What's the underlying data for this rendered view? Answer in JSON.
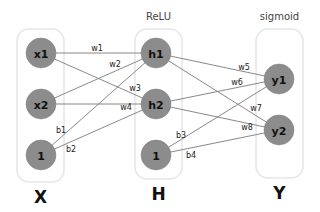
{
  "layers": [
    {
      "id": "X",
      "label": "X",
      "title": "",
      "box": {
        "x": 17,
        "y": 29,
        "w": 47,
        "h": 153
      },
      "nodes": [
        {
          "id": "x1",
          "label": "x1",
          "cx": 41,
          "cy": 53
        },
        {
          "id": "x2",
          "label": "x2",
          "cx": 41,
          "cy": 104
        },
        {
          "id": "bx",
          "label": "1",
          "cx": 41,
          "cy": 155
        }
      ]
    },
    {
      "id": "H",
      "label": "H",
      "title": "ReLU",
      "box": {
        "x": 135,
        "y": 29,
        "w": 47,
        "h": 150
      },
      "nodes": [
        {
          "id": "h1",
          "label": "h1",
          "cx": 156,
          "cy": 53
        },
        {
          "id": "h2",
          "label": "h2",
          "cx": 156,
          "cy": 104
        },
        {
          "id": "bh",
          "label": "1",
          "cx": 156,
          "cy": 155
        }
      ]
    },
    {
      "id": "Y",
      "label": "Y",
      "title": "sigmoid",
      "box": {
        "x": 256,
        "y": 29,
        "w": 47,
        "h": 149
      },
      "nodes": [
        {
          "id": "y1",
          "label": "y1",
          "cx": 279,
          "cy": 79
        },
        {
          "id": "y2",
          "label": "y2",
          "cx": 279,
          "cy": 130
        }
      ]
    }
  ],
  "edges": [
    {
      "from": "x1",
      "to": "h1",
      "label": "w1",
      "lx": 97,
      "ly": 51
    },
    {
      "from": "x2",
      "to": "h1",
      "label": "w2",
      "lx": 115,
      "ly": 67
    },
    {
      "from": "x1",
      "to": "h2",
      "label": "w3",
      "lx": 135,
      "ly": 91
    },
    {
      "from": "x2",
      "to": "h2",
      "label": "w4",
      "lx": 126,
      "ly": 110
    },
    {
      "from": "bx",
      "to": "h1",
      "label": "b1",
      "lx": 61,
      "ly": 133
    },
    {
      "from": "bx",
      "to": "h2",
      "label": "b2",
      "lx": 71,
      "ly": 152
    },
    {
      "from": "h1",
      "to": "y1",
      "label": "w5",
      "lx": 244,
      "ly": 70
    },
    {
      "from": "h2",
      "to": "y1",
      "label": "w6",
      "lx": 237,
      "ly": 85
    },
    {
      "from": "h1",
      "to": "y2",
      "label": "w7",
      "lx": 256,
      "ly": 111
    },
    {
      "from": "h2",
      "to": "y2",
      "label": "w8",
      "lx": 247,
      "ly": 130
    },
    {
      "from": "bh",
      "to": "y1",
      "label": "b3",
      "lx": 181,
      "ly": 138
    },
    {
      "from": "bh",
      "to": "y2",
      "label": "b4",
      "lx": 191,
      "ly": 158
    }
  ],
  "titles": {
    "hidden": "ReLU",
    "output": "sigmoid"
  },
  "colors": {
    "node": "#8c8c8c",
    "edge": "#7a7a7a",
    "box": "#e6e6e6"
  },
  "node_radius": 15
}
